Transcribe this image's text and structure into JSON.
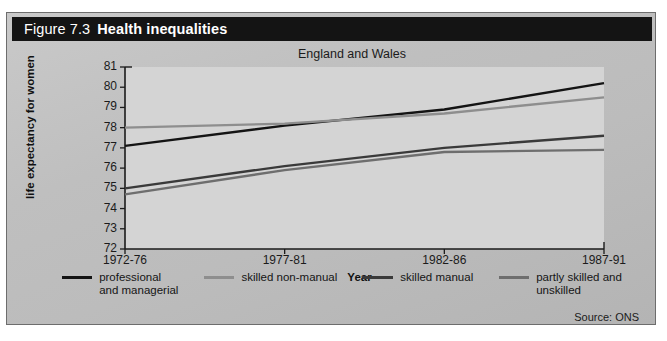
{
  "figure": {
    "number": "Figure 7.3",
    "title": "Health inequalities",
    "source": "Source: ONS"
  },
  "colors": {
    "title_bar_bg": "#141414",
    "title_bar_text": "#ffffff",
    "panel_bg": "#bfbfbf",
    "plot_bg": "#d3d3d3",
    "axis": "#1b1b1b",
    "series_professional": "#141414",
    "series_skilled_non_manual": "#8e8e8e",
    "series_skilled_manual": "#3a3a3a",
    "series_partly_skilled": "#6e6e6e"
  },
  "chart_data": {
    "type": "line",
    "title": "Health inequalities",
    "subtitle": "England and Wales",
    "xlabel": "Year",
    "ylabel": "life expectancy for women",
    "categories": [
      "1972-76",
      "1977-81",
      "1982-86",
      "1987-91"
    ],
    "ylim": [
      72,
      81
    ],
    "yticks": [
      72,
      73,
      74,
      75,
      76,
      77,
      78,
      79,
      80,
      81
    ],
    "grid": false,
    "legend_position": "bottom",
    "series": [
      {
        "name": "professional and managerial",
        "color": "#141414",
        "values": [
          77.1,
          78.1,
          78.9,
          80.2
        ]
      },
      {
        "name": "skilled non-manual",
        "color": "#8e8e8e",
        "values": [
          78.0,
          78.2,
          78.7,
          79.5
        ]
      },
      {
        "name": "skilled manual",
        "color": "#3a3a3a",
        "values": [
          75.0,
          76.1,
          77.0,
          77.6
        ]
      },
      {
        "name": "partly skilled and unskilled",
        "color": "#6e6e6e",
        "values": [
          74.7,
          75.9,
          76.8,
          76.9
        ]
      }
    ]
  },
  "legend": [
    {
      "label_line1": "professional",
      "label_line2": "and managerial"
    },
    {
      "label_line1": "skilled non-manual",
      "label_line2": ""
    },
    {
      "label_line1": "skilled manual",
      "label_line2": ""
    },
    {
      "label_line1": "partly skilled and",
      "label_line2": "unskilled"
    }
  ]
}
